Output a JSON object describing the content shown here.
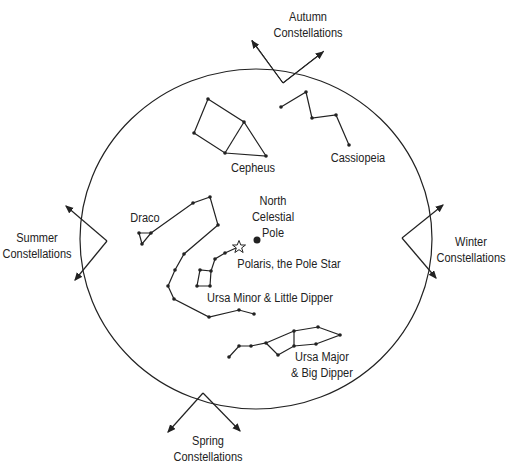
{
  "colors": {
    "line": "#222222",
    "background": "#ffffff"
  },
  "seasons": {
    "autumn": {
      "line1": "Autumn",
      "line2": "Constellations"
    },
    "summer": {
      "line1": "Summer",
      "line2": "Constellations"
    },
    "winter": {
      "line1": "Winter",
      "line2": "Constellations"
    },
    "spring": {
      "line1": "Spring",
      "line2": "Constellations"
    }
  },
  "constellations": {
    "cepheus": "Cepheus",
    "cassiopeia": "Cassiopeia",
    "draco": "Draco",
    "ursa_minor": "Ursa Minor & Little Dipper",
    "ursa_major": {
      "line1": "Ursa Major",
      "line2": "& Big Dipper"
    }
  },
  "markers": {
    "ncp": {
      "line1": "North",
      "line2": "Celestial",
      "line3": "Pole"
    },
    "polaris": "Polaris, the Pole Star"
  }
}
